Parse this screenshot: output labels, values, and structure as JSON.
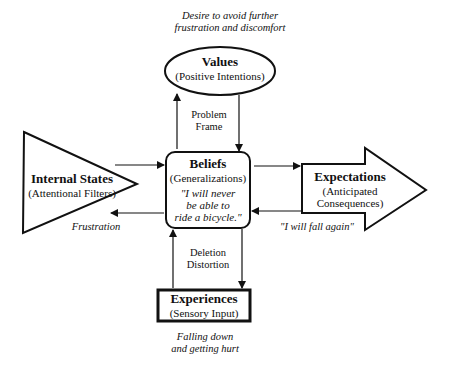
{
  "diagram": {
    "values": {
      "title": "Values",
      "subtitle": "(Positive Intentions)",
      "note_line1": "Desire to avoid further",
      "note_line2": "frustration and discomfort"
    },
    "beliefs": {
      "title": "Beliefs",
      "subtitle": "(Generalizations)",
      "quote_line1": "\"I will never",
      "quote_line2": "be able to",
      "quote_line3": "ride a bicycle.\""
    },
    "internal_states": {
      "title": "Internal States",
      "subtitle": "(Attentional Filters)",
      "note": "Frustration"
    },
    "expectations": {
      "title": "Expectations",
      "subtitle_line1": "(Anticipated",
      "subtitle_line2": "Consequences)",
      "note": "\"I will fall again\""
    },
    "experiences": {
      "title": "Experiences",
      "subtitle": "(Sensory Input)",
      "note_line1": "Falling down",
      "note_line2": "and getting hurt"
    },
    "connectors": {
      "top_label_line1": "Problem",
      "top_label_line2": "Frame",
      "bottom_label_line1": "Deletion",
      "bottom_label_line2": "Distortion"
    },
    "colors": {
      "stroke": "#111111",
      "background": "#ffffff"
    }
  }
}
